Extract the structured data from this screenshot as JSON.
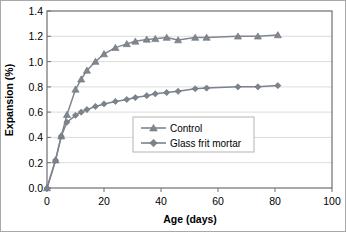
{
  "chart_data": {
    "type": "line",
    "title": "",
    "xlabel": "Age (days)",
    "ylabel": "Expansion (%)",
    "xlim": [
      0,
      100
    ],
    "ylim": [
      0,
      1.4
    ],
    "xticks": [
      0,
      20,
      40,
      60,
      80,
      100
    ],
    "xtick_labels": [
      "0",
      "20",
      "40",
      "60",
      "80",
      "100"
    ],
    "yticks": [
      0.0,
      0.2,
      0.4,
      0.6,
      0.8,
      1.0,
      1.2,
      1.4
    ],
    "ytick_labels": [
      "0.0",
      "0.2",
      "0.4",
      "0.6",
      "0.8",
      "1.0",
      "1.2",
      "1.4"
    ],
    "grid": "horizontal",
    "legend_position": "center",
    "series": [
      {
        "name": "Control",
        "marker": "triangle",
        "color": "#808791",
        "x": [
          0,
          3,
          5,
          7,
          10,
          12,
          14,
          17,
          20,
          24,
          28,
          31,
          35,
          38,
          42,
          46,
          52,
          56,
          67,
          74,
          81
        ],
        "y": [
          0.0,
          0.22,
          0.41,
          0.58,
          0.78,
          0.86,
          0.93,
          1.0,
          1.06,
          1.11,
          1.14,
          1.16,
          1.175,
          1.18,
          1.19,
          1.17,
          1.19,
          1.19,
          1.2,
          1.2,
          1.21
        ]
      },
      {
        "name": "Glass frit mortar",
        "marker": "diamond",
        "color": "#7c838d",
        "x": [
          0,
          3,
          5,
          7,
          10,
          12,
          14,
          17,
          20,
          24,
          28,
          31,
          35,
          38,
          42,
          46,
          52,
          56,
          67,
          74,
          81
        ],
        "y": [
          0.0,
          0.22,
          0.41,
          0.52,
          0.575,
          0.6,
          0.62,
          0.645,
          0.665,
          0.685,
          0.7,
          0.715,
          0.73,
          0.745,
          0.755,
          0.765,
          0.785,
          0.79,
          0.8,
          0.8,
          0.81
        ]
      }
    ]
  },
  "legend": {
    "entries": [
      {
        "label": "Control"
      },
      {
        "label": "Glass frit mortar"
      }
    ]
  },
  "colors": {
    "series_gray": "#808791",
    "axis": "#7a7a7a",
    "grid": "#d9d9d9",
    "border": "#6e6e6e",
    "text": "#000000"
  }
}
